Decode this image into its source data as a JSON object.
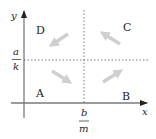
{
  "diagram": {
    "type": "phase-plane",
    "axes": {
      "x_label": "x",
      "y_label": "y",
      "color": "#7a7a7a",
      "arrow_color": "#222222"
    },
    "nullclines": {
      "horizontal": {
        "numerator": "a",
        "denominator": "k",
        "style": "dotted"
      },
      "vertical": {
        "numerator": "b",
        "denominator": "m",
        "style": "dotted"
      },
      "color": "#555555"
    },
    "regions": [
      {
        "label": "A",
        "position": "bottom-left",
        "flow_direction": "down-right"
      },
      {
        "label": "B",
        "position": "bottom-right",
        "flow_direction": "up-right"
      },
      {
        "label": "C",
        "position": "top-right",
        "flow_direction": "up-left"
      },
      {
        "label": "D",
        "position": "top-left",
        "flow_direction": "down-left"
      }
    ],
    "flow_arrow_color": "#cfcfcf"
  }
}
